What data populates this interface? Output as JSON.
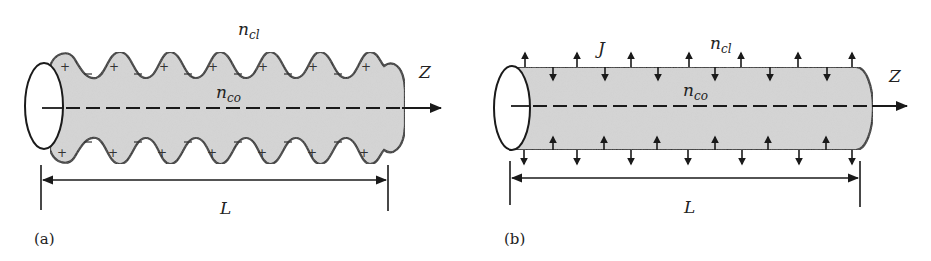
{
  "figure": {
    "panel_a": {
      "caption": "(a)",
      "cladding_index": {
        "base": "n",
        "sub": "cl"
      },
      "core_index": {
        "base": "n",
        "sub": "co"
      },
      "axis_label": "Z",
      "length_label": "L",
      "surface_charges": {
        "outer": "+",
        "inner": "−"
      },
      "corrugation_periods": 7
    },
    "panel_b": {
      "caption": "(b)",
      "current_label": "J",
      "cladding_index": {
        "base": "n",
        "sub": "cl"
      },
      "core_index": {
        "base": "n",
        "sub": "co"
      },
      "axis_label": "Z",
      "length_label": "L",
      "outward_arrows_per_side": 7,
      "inward_arrows_per_side": 6
    },
    "colors": {
      "fiber_fill": "#d6d6d6",
      "outline": "#1a1a1a",
      "background": "#ffffff"
    }
  }
}
